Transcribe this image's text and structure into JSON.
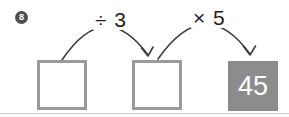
{
  "problem": {
    "badge": "8",
    "arrow1_label": "÷ 3",
    "arrow2_label": "× 5",
    "boxes": [
      {
        "value": "",
        "filled": false
      },
      {
        "value": "",
        "filled": false
      },
      {
        "value": "45",
        "filled": true
      }
    ]
  },
  "colors": {
    "box_border": "#9a9a9a",
    "filled_box_bg": "#8c8c8c",
    "filled_box_text": "#ffffff",
    "arrow_stroke": "#3d3d3d",
    "badge_bg": "#4f4f4f",
    "badge_text": "#ffffff",
    "label_text": "#222222",
    "divider": "#cfcfcf",
    "background": "#ffffff"
  }
}
